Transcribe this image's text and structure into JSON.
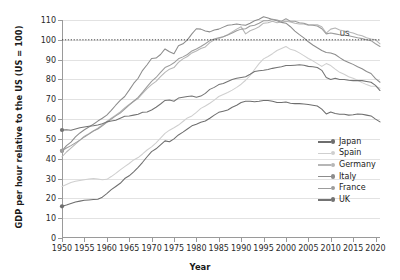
{
  "chart_data": {
    "type": "line",
    "title": "",
    "xlabel": "Year",
    "ylabel": "GDP per hour relative to the US (US = 100)",
    "xlim": [
      1950,
      2021
    ],
    "ylim": [
      0,
      110
    ],
    "yticks": [
      0,
      10,
      20,
      30,
      40,
      50,
      60,
      70,
      80,
      90,
      100,
      110
    ],
    "xticks": [
      1950,
      1955,
      1960,
      1965,
      1970,
      1975,
      1980,
      1985,
      1990,
      1995,
      2000,
      2005,
      2010,
      2015,
      2020
    ],
    "grid": "horizontal",
    "legend_position": "right",
    "reference_line": {
      "value": 100,
      "label": "US",
      "style": "dotted",
      "color": "#333333"
    },
    "x": [
      1950,
      1951,
      1952,
      1953,
      1954,
      1955,
      1956,
      1957,
      1958,
      1959,
      1960,
      1961,
      1962,
      1963,
      1964,
      1965,
      1966,
      1967,
      1968,
      1969,
      1970,
      1971,
      1972,
      1973,
      1974,
      1975,
      1976,
      1977,
      1978,
      1979,
      1980,
      1981,
      1982,
      1983,
      1984,
      1985,
      1986,
      1987,
      1988,
      1989,
      1990,
      1991,
      1992,
      1993,
      1994,
      1995,
      1996,
      1997,
      1998,
      1999,
      2000,
      2001,
      2002,
      2003,
      2004,
      2005,
      2006,
      2007,
      2008,
      2009,
      2010,
      2011,
      2012,
      2013,
      2014,
      2015,
      2016,
      2017,
      2018,
      2019,
      2020,
      2021
    ],
    "series": [
      {
        "name": "Japan",
        "color": "#6e6e6e",
        "start_value": 16,
        "marker_at_start": true,
        "values": [
          16,
          16.6,
          17.4,
          18.2,
          18.6,
          19,
          19.2,
          19.4,
          19.6,
          20.6,
          22.4,
          24.4,
          26,
          27.6,
          30,
          31.4,
          33.4,
          35.6,
          38.2,
          41,
          43.6,
          45,
          47,
          49,
          48.6,
          50,
          52,
          53.4,
          55,
          56.6,
          57.4,
          58.4,
          59,
          60.4,
          62,
          63.4,
          64,
          64.6,
          66,
          67,
          68.4,
          69,
          69,
          68.8,
          69,
          69.4,
          69.4,
          69,
          68.4,
          68.4,
          68.6,
          68,
          67.8,
          67.8,
          67.6,
          67.4,
          67,
          66.6,
          65,
          62.6,
          63.6,
          62.8,
          62.4,
          62.4,
          62,
          62.2,
          62.6,
          62.4,
          62,
          61.6,
          60,
          58.6
        ]
      },
      {
        "name": "Spain",
        "color": "#cfcfcf",
        "start_value": 26,
        "marker_at_start": false,
        "values": [
          26,
          27,
          28,
          28.6,
          29,
          29.4,
          29.8,
          30,
          29.8,
          29.4,
          29.6,
          31,
          32.6,
          34.4,
          36,
          37.6,
          39.4,
          40.6,
          42.4,
          44.4,
          46,
          48,
          50.4,
          52.8,
          54.4,
          55.6,
          57,
          58.8,
          60.6,
          61.6,
          63.4,
          65.4,
          66.6,
          68,
          69.6,
          71.4,
          72.4,
          73.4,
          74.6,
          76,
          77.6,
          79.6,
          82,
          85,
          88,
          90.4,
          91.6,
          93,
          94.6,
          95.6,
          96.6,
          95.2,
          94.6,
          93.4,
          92,
          90.6,
          89.4,
          88,
          86.6,
          88,
          87,
          85.2,
          83.6,
          82.6,
          81.4,
          80.6,
          79.6,
          78.4,
          77.4,
          76.6,
          76.6,
          75.6
        ]
      },
      {
        "name": "Germany",
        "color": "#b6b6b6",
        "start_value": 41,
        "marker_at_start": false,
        "values": [
          41,
          43.4,
          45.4,
          47.4,
          49.4,
          51.4,
          52.6,
          54,
          55.4,
          57,
          58.8,
          60.4,
          62,
          63.6,
          65.6,
          67.4,
          69,
          70.4,
          73,
          75.4,
          77.4,
          79,
          81.4,
          83.6,
          85.2,
          86,
          88.6,
          90.4,
          91.6,
          93.4,
          94.4,
          95.6,
          96.4,
          98.6,
          100,
          100.6,
          101.6,
          102.6,
          104,
          105.4,
          106.6,
          103,
          104.6,
          105.4,
          106.6,
          108.4,
          108.6,
          109.4,
          108.6,
          109,
          109.4,
          109,
          108.4,
          108,
          108,
          107.4,
          107.6,
          107.6,
          106.6,
          103.4,
          105.4,
          106,
          105,
          104.4,
          104,
          103.4,
          102.6,
          102,
          101,
          100.4,
          100,
          98
        ]
      },
      {
        "name": "Italy",
        "color": "#8c8c8c",
        "start_value": 44,
        "marker_at_start": true,
        "values": [
          44,
          46.6,
          48.4,
          51,
          53,
          54.6,
          56,
          57.4,
          59,
          60.4,
          62,
          64.4,
          67,
          69.4,
          71.4,
          74.6,
          78,
          80.6,
          84.6,
          87.4,
          90.6,
          90.8,
          92.6,
          95.4,
          94,
          93,
          97,
          98,
          100,
          103,
          105.6,
          105.4,
          104.4,
          104,
          105,
          105.4,
          106.4,
          107.4,
          107.6,
          108,
          107.6,
          107.4,
          108.4,
          109.6,
          110.4,
          111.6,
          111,
          110.2,
          109.6,
          108.8,
          108.4,
          106.6,
          104.4,
          102.6,
          101,
          99,
          97.4,
          96,
          94.6,
          93.6,
          93.4,
          92.6,
          91,
          89.6,
          88.6,
          87.6,
          86.4,
          85.4,
          84,
          83,
          80.4,
          78.6
        ]
      },
      {
        "name": "France",
        "color": "#9c9c9c",
        "start_value": 44,
        "marker_at_start": true,
        "values": [
          44,
          45.4,
          46.6,
          48,
          49.4,
          51,
          52.4,
          54,
          55,
          56.6,
          58.4,
          60,
          61.6,
          63,
          65,
          67,
          69,
          71,
          73.6,
          76.4,
          79,
          81,
          83.6,
          86,
          87,
          88.4,
          90.4,
          91.4,
          92.6,
          94.4,
          95.4,
          96.6,
          98,
          99.6,
          100.4,
          101,
          101.6,
          102.4,
          103.4,
          104.6,
          105.4,
          105.6,
          107,
          107.4,
          108.4,
          109.6,
          109.6,
          110.4,
          110,
          109.4,
          110.6,
          109.4,
          109.4,
          108.6,
          108.4,
          107.6,
          107.4,
          107,
          105.6,
          103,
          103.4,
          103,
          102.6,
          102.4,
          102,
          101.6,
          101,
          100.6,
          100,
          99.6,
          98,
          96.6
        ]
      },
      {
        "name": "UK",
        "color": "#737373",
        "start_value": 54.5,
        "marker_at_start": true,
        "values": [
          54.5,
          54.6,
          54.4,
          55,
          55.6,
          56,
          56.4,
          56.6,
          57,
          57.6,
          58.6,
          59,
          59.4,
          60.4,
          61.4,
          61.6,
          62,
          62.4,
          63.4,
          63.6,
          64.6,
          66,
          67.6,
          69.4,
          69.6,
          69,
          70.6,
          71,
          71.4,
          71.6,
          71,
          71.6,
          73,
          75,
          76,
          77.4,
          78,
          79,
          80,
          80.6,
          81,
          81.4,
          82.6,
          84,
          84.4,
          84.6,
          85,
          85.6,
          86,
          86.4,
          87,
          87,
          87.2,
          87.4,
          87.2,
          86.6,
          86.4,
          86,
          84.6,
          81,
          80,
          80.6,
          80,
          80,
          79.6,
          79.4,
          79.4,
          79.4,
          79,
          78.6,
          77,
          74.4
        ]
      }
    ]
  },
  "legend": {
    "items": [
      {
        "label": "Japan"
      },
      {
        "label": "Spain"
      },
      {
        "label": "Germany"
      },
      {
        "label": "Italy"
      },
      {
        "label": "France"
      },
      {
        "label": "UK"
      }
    ]
  },
  "annotations": {
    "us": "US"
  }
}
